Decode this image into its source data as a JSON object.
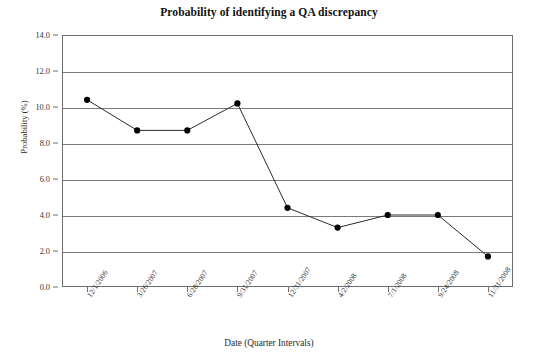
{
  "chart_data": {
    "type": "line",
    "title": "Probability of identifying a QA discrepancy",
    "xlabel": "Date (Quarter Intervals)",
    "ylabel": "Probability (%)",
    "categories": [
      "12/1/2006",
      "3/26/2007",
      "6/28/2007",
      "9/31/2007",
      "12/31/2007",
      "4/2/2008",
      "7/1/2008",
      "9/24/2008",
      "11/31/2008"
    ],
    "values": [
      10.4,
      8.7,
      8.7,
      10.2,
      4.4,
      3.3,
      4.0,
      4.0,
      1.7
    ],
    "ylim": [
      0.0,
      14.0
    ],
    "ytick_labels": [
      "0.0",
      "2.0",
      "4.0",
      "6.0",
      "8.0",
      "10.0",
      "12.0",
      "14.0"
    ],
    "ytick_values": [
      0.0,
      2.0,
      4.0,
      6.0,
      8.0,
      10.0,
      12.0,
      14.0
    ],
    "grid": "horizontal",
    "legend": "none",
    "marker": "filled-circle",
    "line_color": "#2b2b2b",
    "marker_color": "#000000",
    "grid_color": "#7a7a7a",
    "axis_color": "#6d6d6d",
    "background": "#ffffff"
  }
}
